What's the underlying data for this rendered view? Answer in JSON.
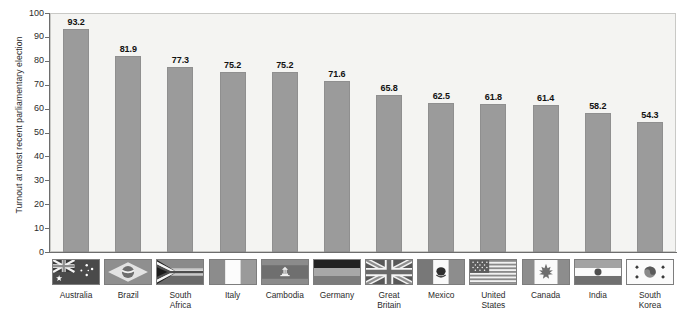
{
  "chart_data": {
    "type": "bar",
    "title": "",
    "xlabel": "",
    "ylabel": "Turnout at most recent parliamentary election",
    "ylim": [
      0,
      100
    ],
    "yticks": [
      100,
      90,
      80,
      70,
      60,
      50,
      40,
      30,
      20,
      10,
      0
    ],
    "grid": false,
    "legend": "none",
    "categories": [
      "Australia",
      "Brazil",
      "South Africa",
      "Italy",
      "Cambodia",
      "Germany",
      "Great Britain",
      "Mexico",
      "United States",
      "Canada",
      "India",
      "South Korea"
    ],
    "values": [
      93.2,
      81.9,
      77.3,
      75.2,
      75.2,
      71.6,
      65.8,
      62.5,
      61.8,
      61.4,
      58.2,
      54.3
    ],
    "data_labels": [
      "93.2",
      "81.9",
      "77.3",
      "75.2",
      "75.2",
      "71.6",
      "65.8",
      "62.5",
      "61.8",
      "61.4",
      "58.2",
      "54.3"
    ],
    "bar_color": "#9b9b9b",
    "plot_background": "#f4f4f2",
    "axis_color": "#6d6d6d"
  },
  "axis": {
    "y_title": "Turnout at most recent parliamentary election",
    "ticks": [
      "100",
      "90",
      "80",
      "70",
      "60",
      "50",
      "40",
      "30",
      "20",
      "10",
      "0"
    ]
  },
  "countries": [
    {
      "name_line1": "Australia",
      "name_line2": "",
      "flag": "flag-australia-icon",
      "value": "93.2"
    },
    {
      "name_line1": "Brazil",
      "name_line2": "",
      "flag": "flag-brazil-icon",
      "value": "81.9"
    },
    {
      "name_line1": "South",
      "name_line2": "Africa",
      "flag": "flag-south-africa-icon",
      "value": "77.3"
    },
    {
      "name_line1": "Italy",
      "name_line2": "",
      "flag": "flag-italy-icon",
      "value": "75.2"
    },
    {
      "name_line1": "Cambodia",
      "name_line2": "",
      "flag": "flag-cambodia-icon",
      "value": "75.2"
    },
    {
      "name_line1": "Germany",
      "name_line2": "",
      "flag": "flag-germany-icon",
      "value": "71.6"
    },
    {
      "name_line1": "Great",
      "name_line2": "Britain",
      "flag": "flag-great-britain-icon",
      "value": "65.8"
    },
    {
      "name_line1": "Mexico",
      "name_line2": "",
      "flag": "flag-mexico-icon",
      "value": "62.5"
    },
    {
      "name_line1": "United",
      "name_line2": "States",
      "flag": "flag-united-states-icon",
      "value": "61.8"
    },
    {
      "name_line1": "Canada",
      "name_line2": "",
      "flag": "flag-canada-icon",
      "value": "61.4"
    },
    {
      "name_line1": "India",
      "name_line2": "",
      "flag": "flag-india-icon",
      "value": "58.2"
    },
    {
      "name_line1": "South",
      "name_line2": "Korea",
      "flag": "flag-south-korea-icon",
      "value": "54.3"
    }
  ],
  "source": {
    "text": ""
  }
}
